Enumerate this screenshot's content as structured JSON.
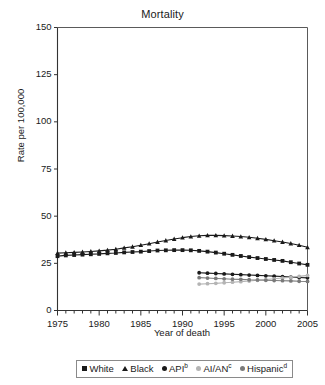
{
  "chart_data": {
    "type": "line",
    "title": "Mortality",
    "xlabel": "Year of death",
    "ylabel": "Rate per 100,000",
    "xlim": [
      1975,
      2005
    ],
    "ylim": [
      0,
      150
    ],
    "ytick_values": [
      0,
      25,
      50,
      75,
      100,
      125,
      150
    ],
    "ytick_labels": [
      "0",
      "25",
      "50",
      "75",
      "100",
      "125",
      "150"
    ],
    "xtick_values": [
      1975,
      1980,
      1985,
      1990,
      1995,
      2000,
      2005
    ],
    "xtick_labels": [
      "1975",
      "1980",
      "1985",
      "1990",
      "1995",
      "2000",
      "2005"
    ],
    "grid": false,
    "legend_position": "below",
    "minor_xticks": "annual",
    "series": [
      {
        "name": "White",
        "label": "White",
        "marker": "square",
        "color": "#1a1a1a",
        "x": [
          1975,
          1976,
          1977,
          1978,
          1979,
          1980,
          1981,
          1982,
          1983,
          1984,
          1985,
          1986,
          1987,
          1988,
          1989,
          1990,
          1991,
          1992,
          1993,
          1994,
          1995,
          1996,
          1997,
          1998,
          1999,
          2000,
          2001,
          2002,
          2003,
          2004,
          2005
        ],
        "values": [
          28.8,
          29.2,
          29.4,
          29.6,
          29.8,
          30.0,
          30.3,
          30.5,
          30.8,
          31.0,
          31.2,
          31.5,
          31.8,
          31.9,
          32.0,
          32.0,
          31.9,
          31.6,
          31.2,
          30.7,
          30.1,
          29.5,
          28.9,
          28.3,
          27.8,
          27.3,
          26.8,
          26.3,
          25.6,
          24.9,
          24.2
        ]
      },
      {
        "name": "Black",
        "label": "Black",
        "marker": "triangle",
        "color": "#1a1a1a",
        "x": [
          1975,
          1976,
          1977,
          1978,
          1979,
          1980,
          1981,
          1982,
          1983,
          1984,
          1985,
          1986,
          1987,
          1988,
          1989,
          1990,
          1991,
          1992,
          1993,
          1994,
          1995,
          1996,
          1997,
          1998,
          1999,
          2000,
          2001,
          2002,
          2003,
          2004,
          2005
        ],
        "values": [
          30.4,
          30.6,
          30.8,
          31.0,
          31.3,
          31.6,
          32.0,
          32.5,
          33.2,
          33.8,
          34.6,
          35.4,
          36.3,
          37.1,
          37.9,
          38.6,
          39.2,
          39.6,
          39.8,
          39.8,
          39.7,
          39.5,
          39.2,
          38.8,
          38.3,
          37.7,
          37.0,
          36.3,
          35.5,
          34.6,
          33.5
        ]
      },
      {
        "name": "API",
        "label": "API",
        "footnote": "b",
        "marker": "circle",
        "color": "#1a1a1a",
        "x": [
          1992,
          1993,
          1994,
          1995,
          1996,
          1997,
          1998,
          1999,
          2000,
          2001,
          2002,
          2003,
          2004,
          2005
        ],
        "values": [
          20.0,
          19.8,
          19.6,
          19.4,
          19.2,
          19.0,
          18.8,
          18.6,
          18.4,
          18.2,
          18.0,
          17.7,
          17.5,
          17.3
        ]
      },
      {
        "name": "AI/AN",
        "label": "AI/AN",
        "footnote": "c",
        "marker": "circle-light",
        "color": "#b4b4b4",
        "x": [
          1992,
          1993,
          1994,
          1995,
          1996,
          1997,
          1998,
          1999,
          2000,
          2001,
          2002,
          2003,
          2004,
          2005
        ],
        "values": [
          14.0,
          14.2,
          14.4,
          14.7,
          15.0,
          15.3,
          15.6,
          16.0,
          16.4,
          16.8,
          17.2,
          17.6,
          18.1,
          18.6
        ]
      },
      {
        "name": "Hispanic",
        "label": "Hispanic",
        "footnote": "d",
        "marker": "circle",
        "color": "#7a7a7a",
        "x": [
          1992,
          1993,
          1994,
          1995,
          1996,
          1997,
          1998,
          1999,
          2000,
          2001,
          2002,
          2003,
          2004,
          2005
        ],
        "values": [
          17.4,
          17.2,
          17.0,
          16.8,
          16.6,
          16.5,
          16.3,
          16.2,
          16.0,
          15.9,
          15.8,
          15.7,
          15.5,
          15.4
        ]
      }
    ]
  }
}
